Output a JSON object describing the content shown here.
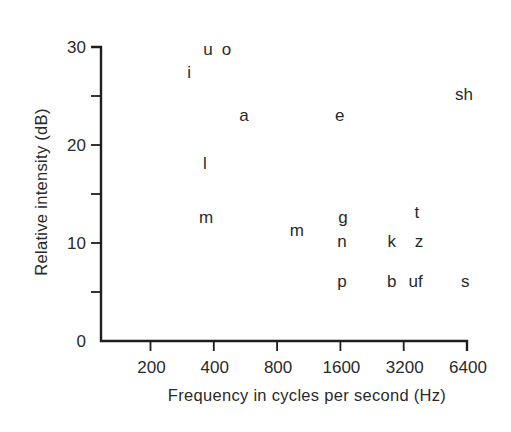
{
  "chart_data": {
    "type": "scatter",
    "title": "",
    "xlabel": "Frequency in cycles per second (Hz)",
    "ylabel": "Relative intensity (dB)",
    "x_scale": "log2",
    "xlim": [
      200,
      6400
    ],
    "ylim": [
      0,
      30
    ],
    "x_ticks": [
      200,
      400,
      800,
      1600,
      3200,
      6400
    ],
    "x_tick_labels": [
      "200",
      "400",
      "800",
      "1600",
      "3200",
      "6400"
    ],
    "y_ticks": [
      0,
      5,
      10,
      15,
      20,
      25,
      30
    ],
    "y_tick_labels": [
      "0",
      "",
      "10",
      "",
      "20",
      "",
      "30"
    ],
    "grid": false,
    "legend": null,
    "marker": "text-label",
    "points": [
      {
        "label": "u",
        "x": 375,
        "y": 29.7
      },
      {
        "label": "o",
        "x": 460,
        "y": 29.7
      },
      {
        "label": "i",
        "x": 305,
        "y": 27.3
      },
      {
        "label": "a",
        "x": 557,
        "y": 23.0
      },
      {
        "label": "e",
        "x": 1590,
        "y": 23.0
      },
      {
        "label": "sh",
        "x": 6190,
        "y": 25.1
      },
      {
        "label": "l",
        "x": 363,
        "y": 18.1
      },
      {
        "label": "m",
        "x": 368,
        "y": 12.6
      },
      {
        "label": "m",
        "x": 993,
        "y": 11.2
      },
      {
        "label": "g",
        "x": 1645,
        "y": 12.6
      },
      {
        "label": "n",
        "x": 1630,
        "y": 10.1
      },
      {
        "label": "t",
        "x": 3700,
        "y": 13.1
      },
      {
        "label": "k",
        "x": 2810,
        "y": 10.1
      },
      {
        "label": "z",
        "x": 3780,
        "y": 10.1
      },
      {
        "label": "p",
        "x": 1630,
        "y": 6.0
      },
      {
        "label": "b",
        "x": 2810,
        "y": 6.0
      },
      {
        "label": "uf",
        "x": 3650,
        "y": 6.0
      },
      {
        "label": "s",
        "x": 6270,
        "y": 6.0
      }
    ]
  },
  "layout": {
    "axis_color": "#1e1e1e",
    "text_color": "#2a2a2a"
  }
}
